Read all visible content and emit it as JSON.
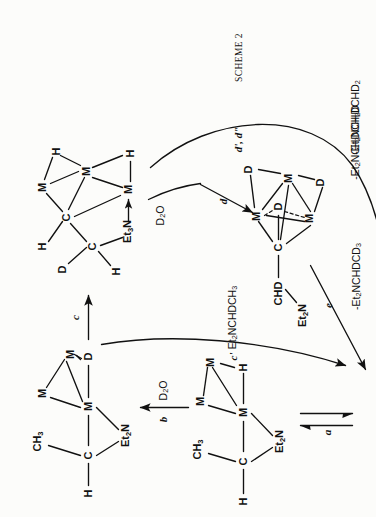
{
  "scheme": {
    "title": "SCHEME 2",
    "page_background": "#fcfcfa",
    "ink_color": "#111111"
  },
  "structures": {
    "a_top_left": {
      "name": "methyl-amido cluster with bridging D",
      "atoms": {
        "ch3": "CH3",
        "h": "H",
        "c": "C",
        "et2n": "Et2N",
        "m_top": "M",
        "m_right": "M",
        "m_center": "M",
        "d": "D"
      }
    },
    "b_top_right": {
      "name": "deuterated alcohol-bridged hydride cluster",
      "atoms": {
        "d": "D",
        "h_up": "H",
        "h_left": "H",
        "c_up": "C",
        "c_low": "C",
        "et3n": "Et3N",
        "m_top": "M",
        "m_right": "M",
        "m_bottom": "M",
        "h_r1": "H",
        "h_r2": "H"
      }
    },
    "c_lower_left": {
      "name": "methyl-amido cluster with terminal H",
      "atoms": {
        "ch3": "CH3",
        "h_left": "H",
        "c": "C",
        "et2n": "Et2N",
        "m_top": "M",
        "m_right": "M",
        "m_center": "M",
        "h_right": "H"
      }
    },
    "d_lower_right": {
      "name": "polydeuterated CHD cluster",
      "atoms": {
        "chd": "CHD",
        "et2n": "Et2N",
        "c": "C",
        "m_top": "M",
        "m_right": "M",
        "m_left": "M",
        "d_center": "D",
        "d_upper": "D",
        "d_lower": "D"
      }
    },
    "product": {
      "name": "trimetal cluster plus triethylamine",
      "atoms": {
        "m_left": "M",
        "m_right": "M",
        "m_bottom": "M"
      },
      "plus": "+",
      "amine": "Et3N"
    }
  },
  "steps": {
    "a": "a",
    "b": "b",
    "c": "c",
    "c_prime": "c'",
    "d": "d",
    "d_primes": "d', d\"",
    "e": "e"
  },
  "reagents": {
    "b_reagent": "D2O",
    "d_reagent": "D2O"
  },
  "products": {
    "c_prime_product": "Et2NCHDCH3",
    "e_product": "-Et2NCHDCD3",
    "d_prime_product_1": "-Et2NCHDCH2D",
    "d_prime_product_2": "-Et2NCHDCHD2"
  }
}
